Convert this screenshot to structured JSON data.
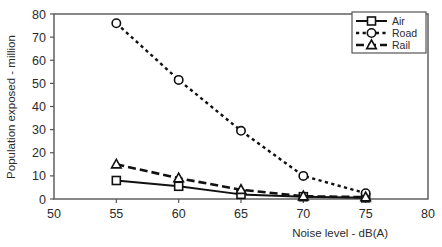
{
  "chart_data": {
    "type": "line",
    "title": "",
    "subtitle": "",
    "xlabel": "Noise level - dB(A)",
    "ylabel": "Population exposed - million",
    "x": [
      55,
      60,
      65,
      70,
      75
    ],
    "xlim": [
      50,
      80
    ],
    "ylim": [
      0,
      80
    ],
    "xticks": [
      50,
      55,
      60,
      65,
      70,
      75,
      80
    ],
    "yticks": [
      0,
      10,
      20,
      30,
      40,
      50,
      60,
      70,
      80
    ],
    "xtick_labels": [
      "50",
      "55",
      "60",
      "65",
      "70",
      "75",
      "80"
    ],
    "ytick_labels": [
      "0",
      "10",
      "20",
      "30",
      "40",
      "50",
      "60",
      "70",
      "80"
    ],
    "grid": false,
    "legend_position": "top-right",
    "series": [
      {
        "name": "Air",
        "values": [
          8,
          5.5,
          2,
          1,
          0.5
        ],
        "marker": "square",
        "line_style": "solid",
        "color": "#111111"
      },
      {
        "name": "Road",
        "values": [
          76,
          51.5,
          29.5,
          10,
          2.5
        ],
        "marker": "circle",
        "line_style": "dotted",
        "color": "#111111"
      },
      {
        "name": "Rail",
        "values": [
          15,
          9,
          4,
          1.2,
          0.8
        ],
        "marker": "triangle",
        "line_style": "dashed",
        "color": "#111111"
      }
    ]
  },
  "legend": {
    "entries": [
      {
        "label": "Air"
      },
      {
        "label": "Road"
      },
      {
        "label": "Rail"
      }
    ]
  },
  "axes": {
    "x_title": "Noise level - dB(A)",
    "y_title": "Population exposed - million"
  },
  "colors": {
    "ink": "#111111",
    "axis": "#555555",
    "background": "#ffffff"
  }
}
